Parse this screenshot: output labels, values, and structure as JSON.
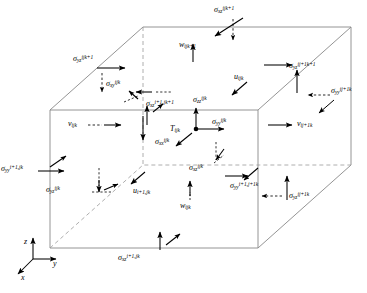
{
  "figure": {
    "type": "staggered-grid-cell-diagram"
  },
  "axes": {
    "z": "z",
    "y": "y",
    "x": "x"
  },
  "center": {
    "temperature": {
      "sym": "T",
      "sub": "ijk"
    }
  },
  "labels": [
    {
      "id": "sigma-xz-ijk1-top",
      "sym": "σ",
      "sub": "xz",
      "sup": "ijk+1",
      "x": 214,
      "y": 6,
      "kind": "stress"
    },
    {
      "id": "sigma-yz-ijk1-left",
      "sym": "σ",
      "sub": "yz",
      "sup": "ijk+1",
      "x": 73,
      "y": 55,
      "kind": "stress"
    },
    {
      "id": "sigma-yz-ij1k1-right",
      "sym": "σ",
      "sub": "yz",
      "sup": "ij+1k+1",
      "x": 289,
      "y": 62,
      "kind": "stress"
    },
    {
      "id": "sigma-yy-ij1k-right",
      "sym": "σ",
      "sub": "yy",
      "sup": "ij+1k",
      "x": 331,
      "y": 87,
      "kind": "stress"
    },
    {
      "id": "sigma-xy-ijk",
      "sym": "σ",
      "sub": "xy",
      "sup": "ijk",
      "x": 106,
      "y": 80,
      "kind": "stress"
    },
    {
      "id": "sigma-xz-i1jk1",
      "sym": "σ",
      "sub": "xz",
      "sup": "i+1,jk+1",
      "x": 146,
      "y": 100,
      "kind": "stress"
    },
    {
      "id": "sigma-zz-ijk",
      "sym": "σ",
      "sub": "zz",
      "sup": "ijk",
      "x": 193,
      "y": 96,
      "kind": "stress"
    },
    {
      "id": "sigma-yy-ijk-center",
      "sym": "σ",
      "sub": "yy",
      "sup": "ijk",
      "x": 212,
      "y": 118,
      "kind": "stress"
    },
    {
      "id": "sigma-xx-ijk",
      "sym": "σ",
      "sub": "xx",
      "sup": "ijk",
      "x": 155,
      "y": 138,
      "kind": "stress"
    },
    {
      "id": "sigma-yy-i1jk-left",
      "sym": "σ",
      "sub": "yy",
      "sup": "i+1,jk",
      "x": 1,
      "y": 165,
      "kind": "stress"
    },
    {
      "id": "sigma-yz-ijk-lower",
      "sym": "σ",
      "sub": "yz",
      "sup": "ijk",
      "x": 46,
      "y": 186,
      "kind": "stress"
    },
    {
      "id": "sigma-xz-ijk-lower",
      "sym": "σ",
      "sub": "xz",
      "sup": "ijk",
      "x": 189,
      "y": 164,
      "kind": "stress"
    },
    {
      "id": "sigma-yy-i1j1k",
      "sym": "σ",
      "sub": "yy",
      "sup": "i+1,j+1k",
      "x": 230,
      "y": 182,
      "kind": "stress"
    },
    {
      "id": "sigma-yz-ij1k-right",
      "sym": "σ",
      "sub": "yz",
      "sup": "ij+1k",
      "x": 289,
      "y": 192,
      "kind": "stress"
    },
    {
      "id": "sigma-xz-i1jk-bottom",
      "sym": "σ",
      "sub": "xz",
      "sup": "i+1,jk",
      "x": 118,
      "y": 254,
      "kind": "stress"
    },
    {
      "id": "w-ijk1",
      "sym": "w",
      "sub": "ijk+1",
      "sup": "",
      "x": 179,
      "y": 41,
      "kind": "velocity"
    },
    {
      "id": "u-ijk",
      "sym": "u",
      "sub": "ijk",
      "sup": "",
      "x": 234,
      "y": 73,
      "kind": "velocity"
    },
    {
      "id": "v-ijk",
      "sym": "v",
      "sub": "ijk",
      "sup": "",
      "x": 68,
      "y": 120,
      "kind": "velocity"
    },
    {
      "id": "v-ij1k",
      "sym": "v",
      "sub": "ij+1k",
      "sup": "",
      "x": 297,
      "y": 120,
      "kind": "velocity"
    },
    {
      "id": "u-i1jk",
      "sym": "u",
      "sub": "i+1,jk",
      "sup": "",
      "x": 133,
      "y": 187,
      "kind": "velocity"
    },
    {
      "id": "w-ijk",
      "sym": "w",
      "sub": "ijk",
      "sup": "",
      "x": 180,
      "y": 202,
      "kind": "velocity"
    }
  ],
  "colors": {
    "line": "#808080",
    "ink": "#000000",
    "background": "#ffffff"
  }
}
